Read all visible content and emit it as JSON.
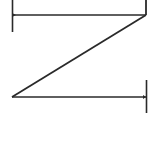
{
  "glyph": {
    "name": "serif-z-shape",
    "stroke_color": "#2a2a2a",
    "background": "#ffffff"
  }
}
